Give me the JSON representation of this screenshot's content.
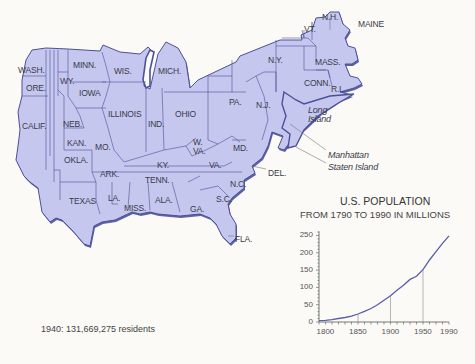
{
  "map": {
    "title": "Contiguous United States (distorted, emphasizing the Northeast)",
    "fill_color": "#c5c7ee",
    "border_color": "#5a5ea8",
    "state_labels": [
      {
        "id": "wash",
        "text": "WASH.",
        "x": 18,
        "y": 66
      },
      {
        "id": "ore",
        "text": "ORE.",
        "x": 26,
        "y": 84
      },
      {
        "id": "calif",
        "text": "CALIF.",
        "x": 22,
        "y": 122
      },
      {
        "id": "wy",
        "text": "WY.",
        "x": 60,
        "y": 77
      },
      {
        "id": "minn",
        "text": "MINN.",
        "x": 73,
        "y": 61
      },
      {
        "id": "iowa",
        "text": "IOWA",
        "x": 79,
        "y": 89
      },
      {
        "id": "neb",
        "text": "NEB.",
        "x": 63,
        "y": 120
      },
      {
        "id": "kan",
        "text": "KAN.",
        "x": 67,
        "y": 139
      },
      {
        "id": "okla",
        "text": "OKLA.",
        "x": 64,
        "y": 156
      },
      {
        "id": "wis",
        "text": "WIS.",
        "x": 114,
        "y": 67
      },
      {
        "id": "mich",
        "text": "MICH.",
        "x": 158,
        "y": 67
      },
      {
        "id": "illinois",
        "text": "ILLINOIS",
        "x": 108,
        "y": 110
      },
      {
        "id": "ind",
        "text": "IND.",
        "x": 148,
        "y": 120
      },
      {
        "id": "ohio",
        "text": "OHIO",
        "x": 175,
        "y": 110
      },
      {
        "id": "mo",
        "text": "MO.",
        "x": 95,
        "y": 143
      },
      {
        "id": "ark",
        "text": "ARK.",
        "x": 100,
        "y": 170
      },
      {
        "id": "ky",
        "text": "KY.",
        "x": 157,
        "y": 161
      },
      {
        "id": "w_va",
        "text": "W.\nVA.",
        "x": 193,
        "y": 138
      },
      {
        "id": "va",
        "text": "VA.",
        "x": 209,
        "y": 161
      },
      {
        "id": "md",
        "text": "MD.",
        "x": 233,
        "y": 144
      },
      {
        "id": "pa",
        "text": "PA.",
        "x": 229,
        "y": 98
      },
      {
        "id": "ny",
        "text": "N.Y.",
        "x": 268,
        "y": 56
      },
      {
        "id": "nj",
        "text": "N.J.",
        "x": 256,
        "y": 101
      },
      {
        "id": "del",
        "text": "DEL.",
        "x": 268,
        "y": 169
      },
      {
        "id": "tenn",
        "text": "TENN.",
        "x": 145,
        "y": 176
      },
      {
        "id": "nc",
        "text": "N.C.",
        "x": 230,
        "y": 180
      },
      {
        "id": "sc",
        "text": "S.C.",
        "x": 216,
        "y": 195
      },
      {
        "id": "texas",
        "text": "TEXAS",
        "x": 69,
        "y": 197
      },
      {
        "id": "la",
        "text": "LA.",
        "x": 108,
        "y": 194
      },
      {
        "id": "miss",
        "text": "MISS.",
        "x": 124,
        "y": 204
      },
      {
        "id": "ala",
        "text": "ALA.",
        "x": 155,
        "y": 196
      },
      {
        "id": "ga",
        "text": "GA.",
        "x": 190,
        "y": 205
      },
      {
        "id": "fla",
        "text": "FLA.",
        "x": 235,
        "y": 235
      },
      {
        "id": "vt",
        "text": "VT.",
        "x": 304,
        "y": 25
      },
      {
        "id": "nh",
        "text": "N.H.",
        "x": 322,
        "y": 13
      },
      {
        "id": "maine",
        "text": "MAINE",
        "x": 358,
        "y": 20
      },
      {
        "id": "mass",
        "text": "MASS.",
        "x": 315,
        "y": 58
      },
      {
        "id": "conn",
        "text": "CONN.",
        "x": 304,
        "y": 79
      },
      {
        "id": "ri",
        "text": "R.I.",
        "x": 331,
        "y": 85
      }
    ],
    "place_labels": [
      {
        "id": "long_island",
        "text": "Long\nIsland",
        "x": 308,
        "y": 106,
        "italic": true
      },
      {
        "id": "manhattan",
        "text": "Manhattan",
        "x": 328,
        "y": 151,
        "italic": true
      },
      {
        "id": "staten_island",
        "text": "Staten Island",
        "x": 328,
        "y": 163,
        "italic": true
      }
    ]
  },
  "chart_data": {
    "type": "line",
    "title": "U.S. POPULATION",
    "subtitle": "FROM 1790 TO 1990 IN MILLIONS",
    "xlabel": "",
    "ylabel": "",
    "x": [
      1790,
      1800,
      1810,
      1820,
      1830,
      1840,
      1850,
      1860,
      1870,
      1880,
      1890,
      1900,
      1910,
      1920,
      1930,
      1940,
      1950,
      1960,
      1970,
      1980,
      1990
    ],
    "series": [
      {
        "name": "U.S. Population (millions)",
        "values": [
          4,
          5,
          7,
          10,
          13,
          17,
          23,
          31,
          39,
          50,
          63,
          76,
          92,
          106,
          123,
          132,
          151,
          179,
          203,
          227,
          249
        ]
      }
    ],
    "xticks": [
      1800,
      1850,
      1900,
      1950,
      1990
    ],
    "yticks": [
      0,
      50,
      100,
      150,
      200,
      250
    ],
    "xlim": [
      1790,
      1990
    ],
    "ylim": [
      0,
      260
    ],
    "grid": false,
    "reference_lines_at": [
      1850,
      1900,
      1950
    ],
    "line_color": "#5a5ea8",
    "axis_color": "#555555"
  },
  "chart_text": {
    "title": "U.S. POPULATION",
    "subtitle": "FROM 1790 TO 1990 IN MILLIONS",
    "yticks": [
      "250",
      "200",
      "150",
      "100",
      "50",
      "0"
    ],
    "xticks": [
      "1800",
      "1850",
      "1900",
      "1950",
      "1990"
    ]
  },
  "caption": {
    "text": "1940: 131,669,275 residents"
  }
}
